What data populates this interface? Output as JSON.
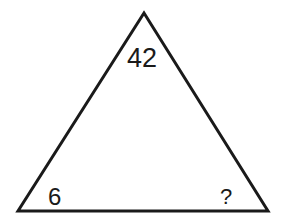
{
  "puzzle": {
    "shape": "triangle",
    "stroke_color": "#1a1a1a",
    "values": {
      "top": "42",
      "bottom_left": "6",
      "bottom_right": "?"
    }
  }
}
